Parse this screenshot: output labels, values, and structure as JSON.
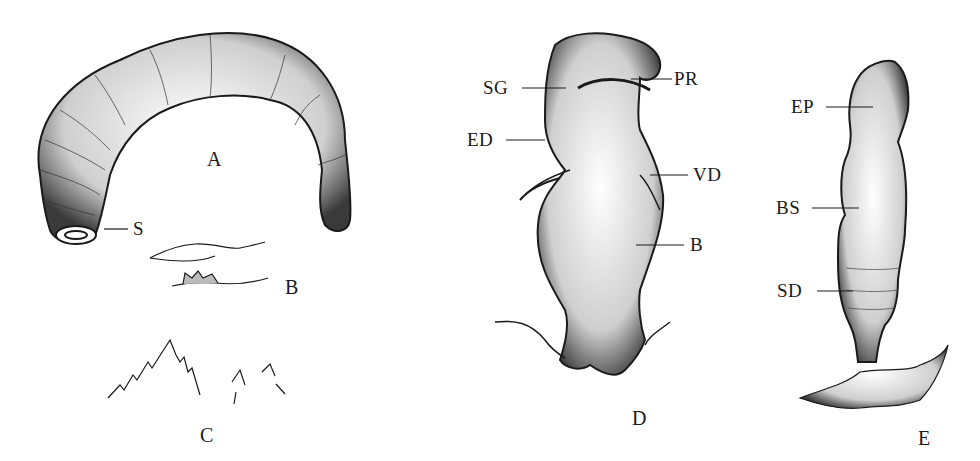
{
  "figure": {
    "panels": [
      {
        "id": "A",
        "label": "A",
        "subject": "larva",
        "parts": [
          {
            "abbr": "S"
          }
        ]
      },
      {
        "id": "B",
        "label": "B",
        "subject": "mouth hooks"
      },
      {
        "id": "C",
        "label": "C",
        "subject": "spines"
      },
      {
        "id": "D",
        "label": "D",
        "subject": "reproductive organ",
        "parts": [
          {
            "abbr": "SG"
          },
          {
            "abbr": "PR"
          },
          {
            "abbr": "ED"
          },
          {
            "abbr": "VD"
          },
          {
            "abbr": "B"
          }
        ]
      },
      {
        "id": "E",
        "label": "E",
        "subject": "organ",
        "parts": [
          {
            "abbr": "EP"
          },
          {
            "abbr": "BS"
          },
          {
            "abbr": "SD"
          }
        ]
      }
    ],
    "colors": {
      "ink": "#1a1a1a",
      "background": "#ffffff",
      "stipple": "#555555"
    }
  }
}
